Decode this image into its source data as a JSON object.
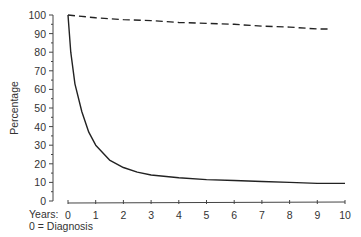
{
  "chart_data": {
    "type": "line",
    "title": "",
    "xlabel": "Years:",
    "xlabel_note": "0 = Diagnosis",
    "ylabel": "Percentage",
    "xlim": [
      0,
      10
    ],
    "ylim": [
      0,
      100
    ],
    "x_ticks": [
      0,
      1,
      2,
      3,
      4,
      5,
      6,
      7,
      8,
      9,
      10
    ],
    "y_ticks": [
      0,
      10,
      20,
      30,
      40,
      50,
      60,
      70,
      80,
      90,
      100
    ],
    "grid": false,
    "legend": null,
    "series": [
      {
        "name": "dashed",
        "style": "dashed",
        "x": [
          0,
          1,
          2,
          3,
          4,
          5,
          6,
          7,
          8,
          9,
          9.5
        ],
        "y": [
          100,
          98.5,
          97.5,
          97,
          96,
          95.5,
          95,
          94,
          93.5,
          92.5,
          92.5
        ]
      },
      {
        "name": "solid",
        "style": "solid",
        "x": [
          0,
          0.1,
          0.25,
          0.5,
          0.75,
          1,
          1.5,
          2,
          2.5,
          3,
          4,
          5,
          6,
          7,
          8,
          9,
          10
        ],
        "y": [
          100,
          80,
          63,
          48,
          37,
          30,
          22,
          18,
          15.5,
          14,
          12.5,
          11.5,
          11,
          10.5,
          10,
          9.5,
          9.5
        ]
      }
    ]
  },
  "labels": {
    "years": "Years:",
    "diagnosis": "0 = Diagnosis",
    "ylabel": "Percentage"
  }
}
